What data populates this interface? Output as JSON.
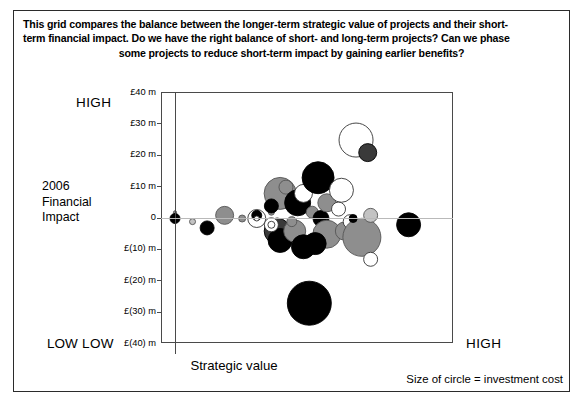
{
  "header": {
    "line1": "This grid compares the balance between the longer-term strategic value of projects and their short-",
    "line2": "term financial impact. Do we have the right balance of short- and long-term projects? Can we phase",
    "line3": "some projects to reduce short-term impact by gaining earlier benefits?"
  },
  "labels": {
    "y_axis_title": "2006\nFinancial\nImpact",
    "y_axis_title_line1": "2006",
    "y_axis_title_line2": "Financial",
    "y_axis_title_line3": "Impact",
    "y_high": "HIGH",
    "y_low": "LOW",
    "x_axis_title": "Strategic value",
    "x_low": "LOW",
    "x_high": "HIGH",
    "legend_note": "Size of circle = investment cost"
  },
  "colors": {
    "frame": "#4a4a4a",
    "zero_line": "#b9b9b9",
    "black": "#000000",
    "dark_gray": "#3a3a3a",
    "mid_gray": "#8e8e8e",
    "light_gray": "#c3c3c3",
    "white": "#ffffff",
    "border": "#2b2b2b"
  },
  "chart_data": {
    "type": "scatter",
    "xlabel": "Strategic value",
    "ylabel": "2006 Financial Impact",
    "xlim": [
      0,
      100
    ],
    "ylim": [
      -40,
      40
    ],
    "grid": false,
    "legend": "Size of circle = investment cost",
    "x_tick_labels": [
      "LOW",
      "HIGH"
    ],
    "y_tick_labels": [
      "£40 m",
      "£30 m",
      "£20 m",
      "£10 m",
      "0",
      "£(10) m",
      "£(20) m",
      "£(30) m",
      "£(40) m"
    ],
    "y_tick_values": [
      40,
      30,
      20,
      10,
      0,
      -10,
      -20,
      -30,
      -40
    ],
    "size_meaning": "investment cost",
    "points": [
      {
        "x": 0,
        "y": 2,
        "r": 1.5,
        "fill": "#8e8e8e",
        "stroke": "#555555"
      },
      {
        "x": 0,
        "y": 0,
        "r": 5,
        "fill": "#000000",
        "stroke": "#000000"
      },
      {
        "x": 6,
        "y": -1,
        "r": 3,
        "fill": "#c3c3c3",
        "stroke": "#555555"
      },
      {
        "x": 11,
        "y": -3,
        "r": 7,
        "fill": "#000000",
        "stroke": "#000000"
      },
      {
        "x": 17,
        "y": 1,
        "r": 9,
        "fill": "#8e8e8e",
        "stroke": "#555555"
      },
      {
        "x": 23,
        "y": 0,
        "r": 3.5,
        "fill": "#8e8e8e",
        "stroke": "#555555"
      },
      {
        "x": 28,
        "y": 0,
        "r": 9,
        "fill": "#ffffff",
        "stroke": "#333333"
      },
      {
        "x": 28,
        "y": 1,
        "r": 5,
        "fill": "#000000",
        "stroke": "#000000"
      },
      {
        "x": 28,
        "y": 0,
        "r": 2.5,
        "fill": "#ffffff",
        "stroke": "#333333"
      },
      {
        "x": 33,
        "y": 2,
        "r": 3,
        "fill": "#8e8e8e",
        "stroke": "#555555"
      },
      {
        "x": 36,
        "y": 8,
        "r": 16,
        "fill": "#8e8e8e",
        "stroke": "#555555"
      },
      {
        "x": 33,
        "y": 4,
        "r": 7,
        "fill": "#000000",
        "stroke": "#000000"
      },
      {
        "x": 38,
        "y": 10,
        "r": 7,
        "fill": "#8e8e8e",
        "stroke": "#555555"
      },
      {
        "x": 35,
        "y": -4,
        "r": 13,
        "fill": "#3a3a3a",
        "stroke": "#000000"
      },
      {
        "x": 36,
        "y": -7,
        "r": 12,
        "fill": "#000000",
        "stroke": "#000000"
      },
      {
        "x": 33,
        "y": -2,
        "r": 7,
        "fill": "#ffffff",
        "stroke": "#333333"
      },
      {
        "x": 33,
        "y": -2,
        "r": 3.5,
        "fill": "#ffffff",
        "stroke": "#333333"
      },
      {
        "x": 42,
        "y": 5,
        "r": 13,
        "fill": "#000000",
        "stroke": "#000000"
      },
      {
        "x": 44,
        "y": 8,
        "r": 9,
        "fill": "#ffffff",
        "stroke": "#333333"
      },
      {
        "x": 41,
        "y": -4,
        "r": 11,
        "fill": "#8e8e8e",
        "stroke": "#555555"
      },
      {
        "x": 44,
        "y": -9,
        "r": 12,
        "fill": "#000000",
        "stroke": "#000000"
      },
      {
        "x": 40,
        "y": -1,
        "r": 5,
        "fill": "#8e8e8e",
        "stroke": "#555555"
      },
      {
        "x": 47,
        "y": 2,
        "r": 6,
        "fill": "#8e8e8e",
        "stroke": "#555555"
      },
      {
        "x": 49,
        "y": 13,
        "r": 16,
        "fill": "#000000",
        "stroke": "#000000"
      },
      {
        "x": 50,
        "y": 0,
        "r": 8,
        "fill": "#000000",
        "stroke": "#000000"
      },
      {
        "x": 52,
        "y": 5,
        "r": 9,
        "fill": "#8e8e8e",
        "stroke": "#555555"
      },
      {
        "x": 52,
        "y": -5,
        "r": 14,
        "fill": "#8e8e8e",
        "stroke": "#555555"
      },
      {
        "x": 48,
        "y": -8,
        "r": 11,
        "fill": "#000000",
        "stroke": "#000000"
      },
      {
        "x": 56,
        "y": 3,
        "r": 7,
        "fill": "#ffffff",
        "stroke": "#333333"
      },
      {
        "x": 57,
        "y": 8,
        "r": 6,
        "fill": "#8e8e8e",
        "stroke": "#555555"
      },
      {
        "x": 58,
        "y": -4,
        "r": 9,
        "fill": "#8e8e8e",
        "stroke": "#555555"
      },
      {
        "x": 60,
        "y": -1,
        "r": 7,
        "fill": "#ffffff",
        "stroke": "#333333"
      },
      {
        "x": 62,
        "y": 25,
        "r": 17,
        "fill": "#ffffff",
        "stroke": "#333333"
      },
      {
        "x": 66,
        "y": 21,
        "r": 9,
        "fill": "#3a3a3a",
        "stroke": "#000000"
      },
      {
        "x": 57,
        "y": 9,
        "r": 12,
        "fill": "#ffffff",
        "stroke": "#333333"
      },
      {
        "x": 64,
        "y": -6,
        "r": 19,
        "fill": "#8e8e8e",
        "stroke": "#555555"
      },
      {
        "x": 61,
        "y": 0,
        "r": 4,
        "fill": "#000000",
        "stroke": "#000000"
      },
      {
        "x": 67,
        "y": 1,
        "r": 7,
        "fill": "#c3c3c3",
        "stroke": "#555555"
      },
      {
        "x": 67,
        "y": -13,
        "r": 7,
        "fill": "#ffffff",
        "stroke": "#333333"
      },
      {
        "x": 80,
        "y": -2,
        "r": 12,
        "fill": "#000000",
        "stroke": "#000000"
      },
      {
        "x": 46,
        "y": -27,
        "r": 22,
        "fill": "#000000",
        "stroke": "#000000"
      }
    ]
  }
}
